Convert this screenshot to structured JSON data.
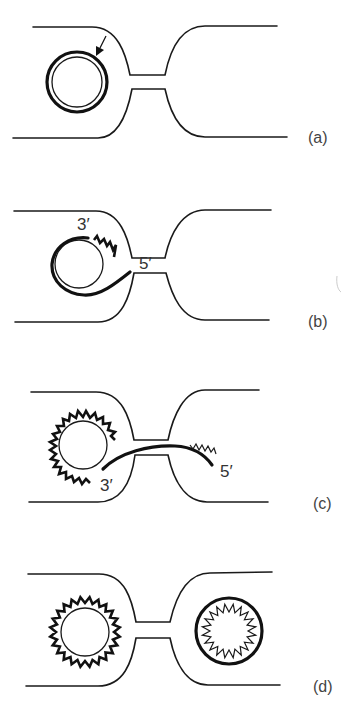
{
  "diagram": {
    "panels": [
      {
        "id": "a",
        "label": "(a)",
        "annotations": [
          "nick arrow on donor plasmid"
        ]
      },
      {
        "id": "b",
        "label": "(b)",
        "end_labels": {
          "three_prime": "3′",
          "five_prime": "5′"
        }
      },
      {
        "id": "c",
        "label": "(c)",
        "end_labels": {
          "three_prime": "3′",
          "five_prime": "5′"
        }
      },
      {
        "id": "d",
        "label": "(d)",
        "annotations": [
          "donor and recipient each with double-stranded plasmid"
        ]
      }
    ],
    "colors": {
      "line": "#1a1a1a",
      "background": "#ffffff",
      "label": "#444444"
    }
  }
}
